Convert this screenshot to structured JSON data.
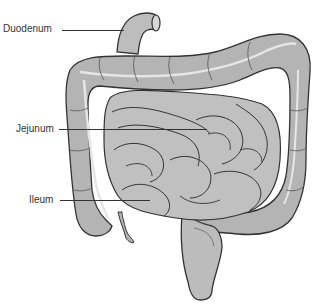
{
  "diagram": {
    "labels": [
      {
        "id": "duodenum",
        "text": "Duodenum"
      },
      {
        "id": "jejunum",
        "text": "Jejunum"
      },
      {
        "id": "ileum",
        "text": "Ileum"
      }
    ],
    "colors": {
      "organ_fill": "#b4b4b4",
      "organ_light": "#c8c8c8",
      "outline": "#333333",
      "highlight": "#e6e6e6",
      "background": "#ffffff"
    }
  }
}
